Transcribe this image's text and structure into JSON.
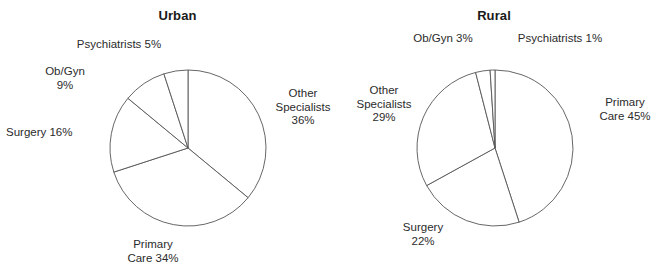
{
  "figure": {
    "background": "#ffffff",
    "line_color": "#555555",
    "text_color": "#2b2b2b"
  },
  "chart_data": [
    {
      "type": "pie",
      "title": "Urban",
      "xlabel": "",
      "ylabel": "",
      "grid": false,
      "legend": "none",
      "start_angle_deg": 90,
      "direction": "clockwise",
      "labels": [
        "Other Specialists",
        "Primary Care",
        "Surgery",
        "Ob/Gyn",
        "Psychiatrists"
      ],
      "values": [
        36,
        34,
        16,
        9,
        5
      ],
      "units": "percent",
      "slices": [
        {
          "label": "Other Specialists",
          "value": 36,
          "value_text": "36%",
          "label_text": "Other\nSpecialists\n36%"
        },
        {
          "label": "Primary Care",
          "value": 34,
          "value_text": "34%",
          "label_text": "Primary\nCare 34%"
        },
        {
          "label": "Surgery",
          "value": 16,
          "value_text": "16%",
          "label_text": "Surgery 16%"
        },
        {
          "label": "Ob/Gyn",
          "value": 9,
          "value_text": "9%",
          "label_text": "Ob/Gyn\n9%"
        },
        {
          "label": "Psychiatrists",
          "value": 5,
          "value_text": "5%",
          "label_text": "Psychiatrists 5%"
        }
      ]
    },
    {
      "type": "pie",
      "title": "Rural",
      "xlabel": "",
      "ylabel": "",
      "grid": false,
      "legend": "none",
      "start_angle_deg": 90,
      "direction": "clockwise",
      "labels": [
        "Primary Care",
        "Surgery",
        "Other Specialists",
        "Ob/Gyn",
        "Psychiatrists"
      ],
      "values": [
        45,
        22,
        29,
        3,
        1
      ],
      "units": "percent",
      "slices": [
        {
          "label": "Primary Care",
          "value": 45,
          "value_text": "45%",
          "label_text": "Primary\nCare 45%"
        },
        {
          "label": "Surgery",
          "value": 22,
          "value_text": "22%",
          "label_text": "Surgery\n22%"
        },
        {
          "label": "Other Specialists",
          "value": 29,
          "value_text": "29%",
          "label_text": "Other\nSpecialists\n29%"
        },
        {
          "label": "Ob/Gyn",
          "value": 3,
          "value_text": "3%",
          "label_text": "Ob/Gyn 3%"
        },
        {
          "label": "Psychiatrists",
          "value": 1,
          "value_text": "1%",
          "label_text": "Psychiatrists 1%"
        }
      ]
    }
  ]
}
